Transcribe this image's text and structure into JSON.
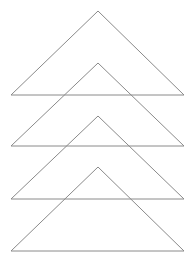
{
  "diagram": {
    "stroke_color": "#8a8a8a",
    "background": "#ffffff",
    "triangles": [
      {
        "apex": [
          98,
          11
        ],
        "left": [
          11,
          95
        ],
        "right": [
          184,
          95
        ]
      },
      {
        "apex": [
          98,
          63
        ],
        "left": [
          11,
          146
        ],
        "right": [
          184,
          146
        ]
      },
      {
        "apex": [
          98,
          116
        ],
        "left": [
          11,
          199
        ],
        "right": [
          184,
          199
        ]
      },
      {
        "apex": [
          98,
          167
        ],
        "left": [
          11,
          251
        ],
        "right": [
          184,
          251
        ]
      }
    ]
  }
}
